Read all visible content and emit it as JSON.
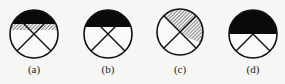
{
  "figure": {
    "panels": [
      {
        "label": "(a)",
        "cx": 34,
        "cy": 34,
        "r": 24,
        "fill": "black top segment with hatched band below",
        "black_to": 24,
        "hatch_to": 30,
        "lines": "X cross"
      },
      {
        "label": "(b)",
        "cx": 108,
        "cy": 34,
        "r": 24,
        "fill": "black top segment",
        "black_to": 27,
        "lines": "X cross"
      },
      {
        "label": "(c)",
        "cx": 180,
        "cy": 32,
        "r": 23,
        "fill": "hatched top and upper-right wedge",
        "lines": "X cross"
      },
      {
        "label": "(d)",
        "cx": 253,
        "cy": 34,
        "r": 24,
        "fill": "black upper half",
        "black_to": 34,
        "lines": "inverted V from center"
      }
    ],
    "colors": {
      "line": "#111111",
      "fill": "#0a0a0a",
      "hatch": "#777777",
      "background": "#f6f6f4"
    }
  }
}
